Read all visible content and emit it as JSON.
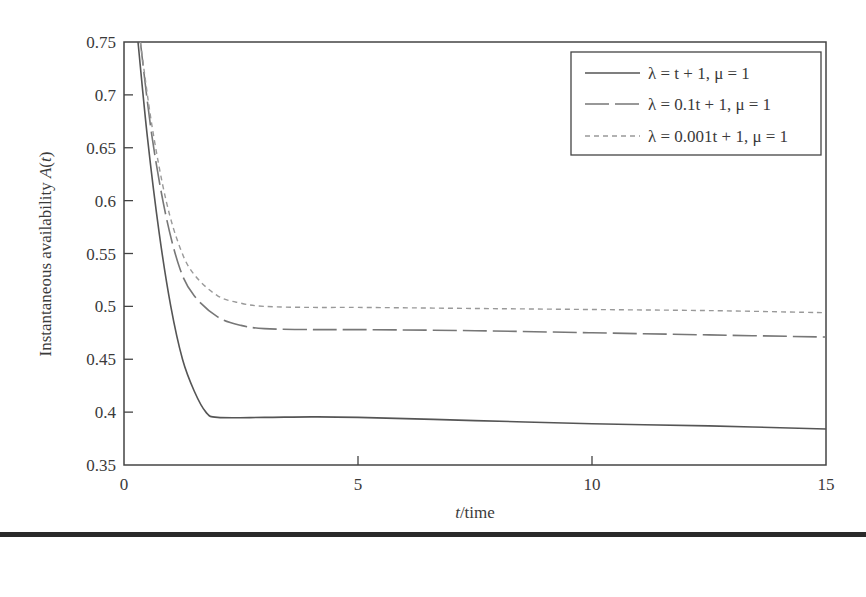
{
  "chart_data": {
    "type": "line",
    "title": "",
    "xlabel": "t/time",
    "ylabel": "Instantaneous availability A(t)",
    "xlim": [
      0,
      15
    ],
    "ylim": [
      0.35,
      0.75
    ],
    "x_ticks": [
      0,
      5,
      10,
      15
    ],
    "x_tick_labels": [
      "0",
      "5",
      "10",
      "15"
    ],
    "y_ticks": [
      0.35,
      0.4,
      0.45,
      0.5,
      0.55,
      0.6,
      0.65,
      0.7,
      0.75
    ],
    "y_tick_labels": [
      "0.35",
      "0.4",
      "0.45",
      "0.5",
      "0.55",
      "0.6",
      "0.65",
      "0.7",
      "0.75"
    ],
    "grid": false,
    "legend_position": "upper right",
    "series": [
      {
        "name": "λ = t + 1, μ = 1",
        "style": "solid",
        "color": "#555555",
        "x": [
          0.3,
          0.5,
          0.75,
          1.0,
          1.25,
          1.5,
          1.75,
          2.0,
          3.0,
          4.0,
          5.0,
          7.5,
          10.0,
          12.5,
          15.0
        ],
        "values": [
          0.75,
          0.66,
          0.57,
          0.5,
          0.45,
          0.42,
          0.4,
          0.395,
          0.395,
          0.3955,
          0.395,
          0.392,
          0.389,
          0.387,
          0.384
        ]
      },
      {
        "name": "λ = 0.1t + 1, μ = 1",
        "style": "dashed",
        "color": "#777777",
        "x": [
          0.35,
          0.6,
          0.9,
          1.2,
          1.5,
          2.0,
          2.5,
          3.0,
          4.0,
          5.0,
          7.5,
          10.0,
          12.5,
          15.0
        ],
        "values": [
          0.75,
          0.66,
          0.585,
          0.535,
          0.51,
          0.49,
          0.482,
          0.479,
          0.478,
          0.478,
          0.477,
          0.475,
          0.473,
          0.471
        ]
      },
      {
        "name": "λ = 0.001t + 1, μ = 1",
        "style": "dotted",
        "color": "#999999",
        "x": [
          0.35,
          0.6,
          0.9,
          1.2,
          1.5,
          2.0,
          2.5,
          3.0,
          4.0,
          5.0,
          7.5,
          10.0,
          12.5,
          15.0
        ],
        "values": [
          0.75,
          0.67,
          0.6,
          0.555,
          0.53,
          0.51,
          0.503,
          0.5,
          0.499,
          0.499,
          0.498,
          0.497,
          0.496,
          0.494
        ]
      }
    ]
  },
  "legend": {
    "items": [
      {
        "label": "λ = t + 1, μ = 1"
      },
      {
        "label": "λ = 0.1t + 1, μ = 1"
      },
      {
        "label": "λ = 0.001t + 1, μ = 1"
      }
    ]
  },
  "axes": {
    "x_label_italic": "t",
    "x_label_rest": "/time",
    "y_label_text": "Instantaneous availability ",
    "y_label_italic": "A",
    "y_label_open": "(",
    "y_label_var": "t",
    "y_label_close": ")"
  }
}
